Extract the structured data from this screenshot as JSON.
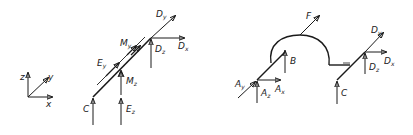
{
  "figure": {
    "left": {
      "axes": {
        "z": "z",
        "y": "y",
        "x": "x"
      },
      "labels": {
        "C": "C",
        "Ey": {
          "main": "E",
          "sub": "y"
        },
        "My": {
          "main": "M",
          "sub": "y"
        },
        "Dy": {
          "main": "D",
          "sub": "y"
        },
        "Dx": {
          "main": "D",
          "sub": "x"
        },
        "Dz": {
          "main": "D",
          "sub": "z"
        },
        "Mz": {
          "main": "M",
          "sub": "z"
        },
        "Ez": {
          "main": "E",
          "sub": "z"
        }
      }
    },
    "right": {
      "labels": {
        "F": "F",
        "B": "B",
        "C": "C",
        "Ay": {
          "main": "A",
          "sub": "y"
        },
        "Ax": {
          "main": "A",
          "sub": "x"
        },
        "Az": {
          "main": "A",
          "sub": "z"
        },
        "Dy": {
          "main": "D",
          "sub": "y"
        },
        "Dx": {
          "main": "D",
          "sub": "x"
        },
        "Dz": {
          "main": "D",
          "sub": "z"
        }
      }
    }
  }
}
